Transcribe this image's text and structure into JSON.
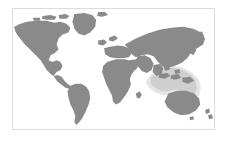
{
  "widget": {
    "name": "world-map-thumbnail",
    "caption": ""
  },
  "map": {
    "projection": "equirectangular",
    "background_color": "#ffffff",
    "border_color": "#dcdcdc",
    "land_color": "#8a8a8a",
    "highlight_color": "#cfcfcf",
    "frame": {
      "x": 12,
      "y": 8,
      "width": 203,
      "height": 122
    },
    "lon_range": [
      -180,
      180
    ],
    "lat_range": [
      -60,
      84
    ],
    "regions": [
      {
        "name": "north-america",
        "label": "North America",
        "style": "land"
      },
      {
        "name": "greenland",
        "label": "Greenland",
        "style": "land"
      },
      {
        "name": "south-america",
        "label": "South America",
        "style": "land"
      },
      {
        "name": "africa",
        "label": "Africa",
        "style": "land"
      },
      {
        "name": "europe",
        "label": "Europe",
        "style": "land"
      },
      {
        "name": "asia",
        "label": "Asia",
        "style": "land"
      },
      {
        "name": "australia",
        "label": "Australia",
        "style": "land"
      },
      {
        "name": "new-zealand",
        "label": "New Zealand",
        "style": "land"
      },
      {
        "name": "southeast-asia-highlight",
        "label": "Southeast Asia / Oceania",
        "style": "highlight"
      }
    ]
  }
}
